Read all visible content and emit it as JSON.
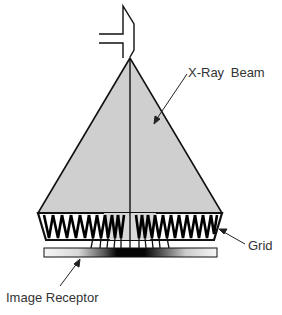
{
  "diagram": {
    "labels": {
      "beam": "X-Ray Beam",
      "grid": "Grid",
      "receptor": "Image Receptor"
    },
    "colors": {
      "beam_fill": "#cfcfcf",
      "outline": "#111111",
      "label_text": "#333333",
      "receptor_dark": "#000000",
      "receptor_light": "#f4f4f4"
    },
    "components": [
      "x-ray tube",
      "x-ray beam",
      "grid",
      "image receptor"
    ]
  }
}
